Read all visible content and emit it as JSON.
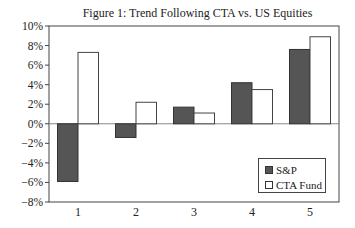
{
  "chart_data": {
    "type": "bar",
    "title": "Figure 1: Trend Following CTA vs. US Equities",
    "xlabel": "",
    "ylabel": "",
    "categories": [
      "1",
      "2",
      "3",
      "4",
      "5"
    ],
    "series": [
      {
        "name": "S&P",
        "color": "#555555",
        "values": [
          -5.9,
          -1.4,
          1.7,
          4.2,
          7.6
        ]
      },
      {
        "name": "CTA Fund",
        "color": "#ffffff",
        "values": [
          7.3,
          2.2,
          1.1,
          3.5,
          8.9
        ]
      }
    ],
    "ylim": [
      -8,
      10
    ],
    "yticks": [
      -8,
      -6,
      -4,
      -2,
      0,
      2,
      4,
      6,
      8,
      10
    ],
    "ytick_labels": [
      "−8%",
      "−6%",
      "−4%",
      "−2%",
      "0%",
      "2%",
      "4%",
      "6%",
      "8%",
      "10%"
    ],
    "grid": false,
    "legend_position": "lower right"
  }
}
